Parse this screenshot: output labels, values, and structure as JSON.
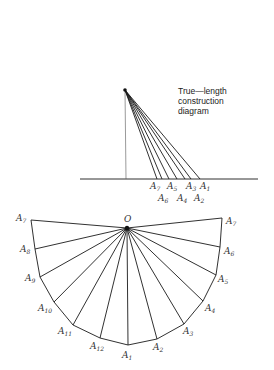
{
  "caption": {
    "lines": [
      "True—length",
      "construction",
      "diagram"
    ]
  },
  "construction": {
    "apex": [
      125,
      90
    ],
    "foot": [
      126,
      179
    ],
    "baseline": {
      "x1": 80,
      "x2": 258,
      "y": 179
    },
    "points": [
      {
        "name": "A7",
        "sub": "7",
        "x": 157,
        "row": 0,
        "lx": 150
      },
      {
        "name": "A6",
        "sub": "6",
        "x": 162,
        "row": 1,
        "lx": 158
      },
      {
        "name": "A5",
        "sub": "5",
        "x": 169,
        "row": 0,
        "lx": 167
      },
      {
        "name": "A4",
        "sub": "4",
        "x": 177,
        "row": 1,
        "lx": 177
      },
      {
        "name": "A3",
        "sub": "3",
        "x": 185,
        "row": 0,
        "lx": 186
      },
      {
        "name": "A2",
        "sub": "2",
        "x": 191,
        "row": 1,
        "lx": 194
      },
      {
        "name": "A1",
        "sub": "1",
        "x": 200,
        "row": 0,
        "lx": 200
      }
    ]
  },
  "development": {
    "origin": {
      "label": "O",
      "x": 127,
      "y": 228
    },
    "points": [
      {
        "sub": "7",
        "x": 31,
        "y": 220,
        "lx": 16,
        "ly": 221
      },
      {
        "sub": "8",
        "x": 35,
        "y": 249,
        "lx": 20,
        "ly": 252
      },
      {
        "sub": "9",
        "x": 40,
        "y": 277,
        "lx": 25,
        "ly": 281
      },
      {
        "sub": "10",
        "x": 54,
        "y": 302,
        "lx": 38,
        "ly": 311
      },
      {
        "sub": "11",
        "x": 73,
        "y": 325,
        "lx": 58,
        "ly": 334
      },
      {
        "sub": "12",
        "x": 100,
        "y": 338,
        "lx": 90,
        "ly": 349
      },
      {
        "sub": "1",
        "x": 128,
        "y": 345,
        "lx": 122,
        "ly": 358
      },
      {
        "sub": "2",
        "x": 157,
        "y": 339,
        "lx": 153,
        "ly": 350
      },
      {
        "sub": "3",
        "x": 184,
        "y": 324,
        "lx": 183,
        "ly": 334
      },
      {
        "sub": "4",
        "x": 203,
        "y": 301,
        "lx": 205,
        "ly": 311
      },
      {
        "sub": "5",
        "x": 216,
        "y": 275,
        "lx": 218,
        "ly": 282
      },
      {
        "sub": "6",
        "x": 220,
        "y": 247,
        "lx": 224,
        "ly": 254
      },
      {
        "sub": "7",
        "x": 222,
        "y": 218,
        "lx": 226,
        "ly": 224
      }
    ]
  }
}
